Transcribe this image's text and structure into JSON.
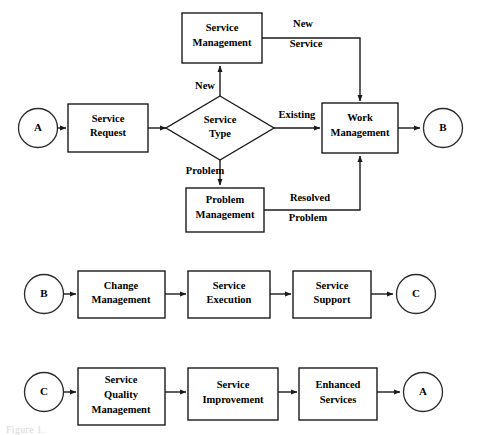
{
  "figure": {
    "caption": "Figure 1.",
    "background_color": "#ffffff",
    "line_color": "#1a1a1a",
    "text_color": "#000000"
  },
  "rows": {
    "row1": {
      "name": "service-request-routing",
      "nodes": {
        "start_connector": {
          "label": "A",
          "shape": "circle"
        },
        "service_request": {
          "label_line1": "Service",
          "label_line2": "Request",
          "shape": "rect"
        },
        "service_type": {
          "label_line1": "Service",
          "label_line2": "Type",
          "shape": "diamond"
        },
        "service_management": {
          "label_line1": "Service",
          "label_line2": "Management",
          "shape": "rect"
        },
        "problem_management": {
          "label_line1": "Problem",
          "label_line2": "Management",
          "shape": "rect"
        },
        "work_management": {
          "label_line1": "Work",
          "label_line2": "Management",
          "shape": "rect"
        },
        "end_connector": {
          "label": "B",
          "shape": "circle"
        }
      },
      "edge_labels": {
        "new": "New",
        "existing": "Existing",
        "problem": "Problem",
        "new_service_line1": "New",
        "new_service_line2": "Service",
        "resolved_problem_line1": "Resolved",
        "resolved_problem_line2": "Problem"
      }
    },
    "row2": {
      "name": "change-execution-support",
      "nodes": {
        "start_connector": {
          "label": "B",
          "shape": "circle"
        },
        "change_management": {
          "label_line1": "Change",
          "label_line2": "Management",
          "shape": "rect"
        },
        "service_execution": {
          "label_line1": "Service",
          "label_line2": "Execution",
          "shape": "rect"
        },
        "service_support": {
          "label_line1": "Service",
          "label_line2": "Support",
          "shape": "rect"
        },
        "end_connector": {
          "label": "C",
          "shape": "circle"
        }
      }
    },
    "row3": {
      "name": "quality-improvement-enhancement",
      "nodes": {
        "start_connector": {
          "label": "C",
          "shape": "circle"
        },
        "service_quality_management": {
          "label_line1": "Service",
          "label_line2": "Quality",
          "label_line3": "Management",
          "shape": "rect"
        },
        "service_improvement": {
          "label_line1": "Service",
          "label_line2": "Improvement",
          "shape": "rect"
        },
        "enhanced_services": {
          "label_line1": "Enhanced",
          "label_line2": "Services",
          "shape": "rect"
        },
        "end_connector": {
          "label": "A",
          "shape": "circle"
        }
      }
    }
  }
}
